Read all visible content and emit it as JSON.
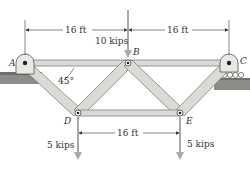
{
  "diagram": {
    "type": "truss",
    "nodes": {
      "A": {
        "label": "A",
        "support": "pin"
      },
      "B": {
        "label": "B"
      },
      "C": {
        "label": "C",
        "support": "roller"
      },
      "D": {
        "label": "D"
      },
      "E": {
        "label": "E"
      }
    },
    "members": [
      "AB",
      "BC",
      "AD",
      "BD",
      "BE",
      "CE",
      "DE"
    ],
    "dimensions": {
      "top_left": "16 ft",
      "top_right": "16 ft",
      "bottom": "16 ft"
    },
    "angle_label": "45°",
    "loads": {
      "B": "10 kips",
      "D": "5 kips",
      "E": "5 kips"
    },
    "colors": {
      "member_fill": "#d9dcd6",
      "member_stroke": "#7d8079",
      "ground": "#8c8d88",
      "load_arrow": "#a8aaa6",
      "text": "#333333"
    }
  }
}
